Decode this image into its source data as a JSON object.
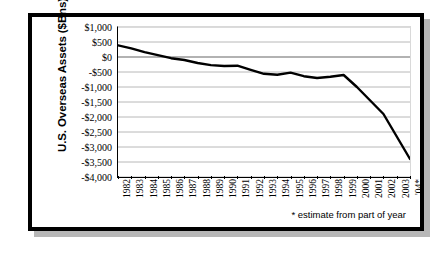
{
  "chart_data": {
    "type": "line",
    "title": "",
    "xlabel": "",
    "ylabel": "U.S. Overseas Assets ($Bns)",
    "ylim": [
      -4000,
      1000
    ],
    "ytick_step": 500,
    "grid": true,
    "legend": null,
    "line_color": "#000000",
    "categories": [
      "1982",
      "1983",
      "1984",
      "1985",
      "1986",
      "1987",
      "1988",
      "1989",
      "1990",
      "1991",
      "1992",
      "1993",
      "1994",
      "1995",
      "1996",
      "1997",
      "1998",
      "1999",
      "2000",
      "2001",
      "2002",
      "2003",
      "'04*"
    ],
    "values": [
      390,
      290,
      160,
      60,
      -40,
      -100,
      -200,
      -270,
      -300,
      -290,
      -430,
      -560,
      -590,
      -520,
      -640,
      -700,
      -660,
      -600,
      -1000,
      -1450,
      -1900,
      -2650,
      -3400
    ],
    "yticks": [
      "$1,000",
      "$500",
      "$0",
      "-$500",
      "-$1,000",
      "-$1,500",
      "-$2,000",
      "-$2,500",
      "-$3,000",
      "-$3,500",
      "-$4,000"
    ],
    "ytick_values": [
      1000,
      500,
      0,
      -500,
      -1000,
      -1500,
      -2000,
      -2500,
      -3000,
      -3500,
      -4000
    ],
    "annotations": [
      {
        "name": "estimate-footnote",
        "text": "* estimate from part of year"
      }
    ]
  },
  "figure": {
    "footnote": "* estimate from part of year",
    "axis_title": "U.S. Overseas Assets ($Bns)",
    "border_color": "#000000",
    "grid_color": "#808080",
    "plot_background": "#ffffff"
  }
}
